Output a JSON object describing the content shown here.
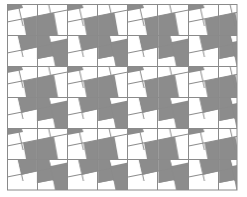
{
  "figure": {
    "background_color": "#ffffff",
    "fill_color": "#8c8c8c",
    "line_color": "#8a8a8a",
    "grid": {
      "left": 7,
      "top": 4,
      "right": 237,
      "bottom": 190,
      "columns": 8,
      "rows": 6,
      "cell_width": 28.75,
      "cell_height": 31
    },
    "period": {
      "width": 60.5,
      "height": 62
    }
  }
}
